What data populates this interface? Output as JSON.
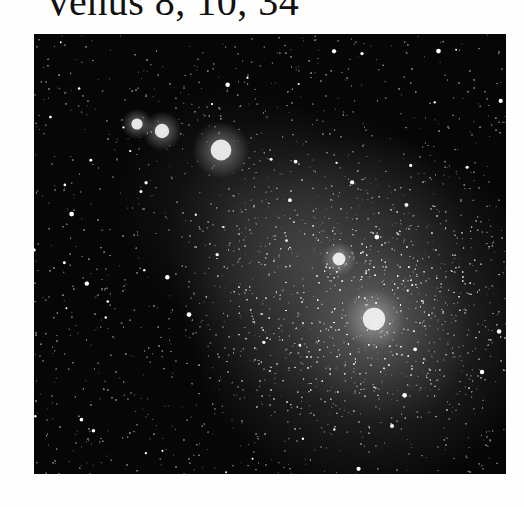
{
  "caption": {
    "text": "Venus 8, 10, 34"
  },
  "photo": {
    "subject": "galaxy",
    "description": "Grayscale astronomical photograph of a dense star field with a diffuse irregular galaxy glow extending diagonally from upper-left to lower-right, with bright nebula knots in the upper left.",
    "background_color": "#060606",
    "bright_knots": [
      {
        "x": 103,
        "y": 90,
        "r": 7
      },
      {
        "x": 128,
        "y": 97,
        "r": 9
      },
      {
        "x": 187,
        "y": 116,
        "r": 13
      },
      {
        "x": 340,
        "y": 285,
        "r": 14
      },
      {
        "x": 305,
        "y": 225,
        "r": 8
      }
    ]
  }
}
